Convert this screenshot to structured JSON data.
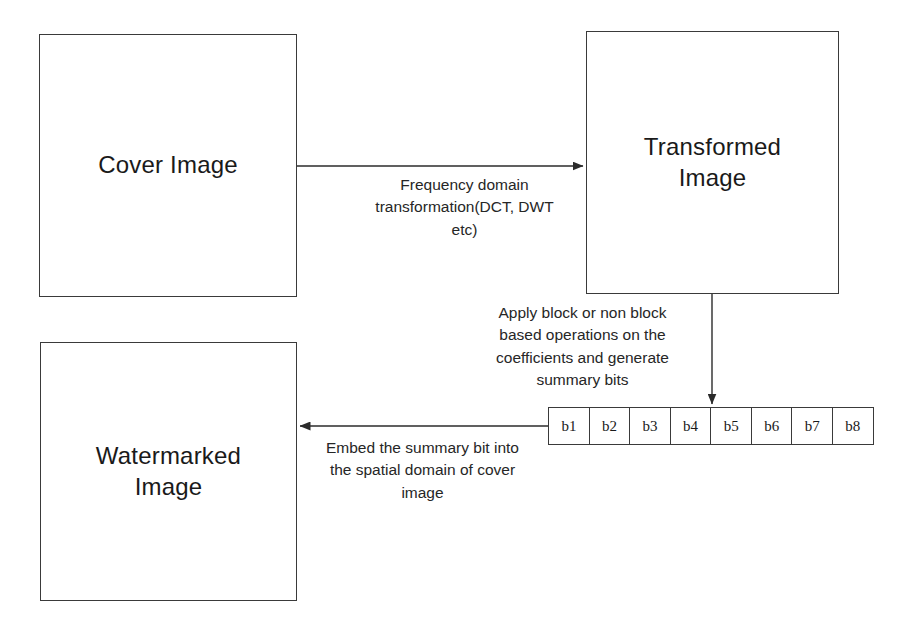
{
  "diagram": {
    "boxes": [
      {
        "id": "cover",
        "label": "Cover Image"
      },
      {
        "id": "transformed",
        "label": "Transformed\nImage"
      },
      {
        "id": "watermarked",
        "label": "Watermarked\nImage"
      }
    ],
    "edges": [
      {
        "id": "transform",
        "from": "cover",
        "to": "transformed",
        "direction": "right",
        "label": "Frequency domain\ntransformation(DCT, DWT\netc)"
      },
      {
        "id": "apply",
        "from": "transformed",
        "to": "bit-array",
        "direction": "down",
        "label": "Apply block or non block\nbased operations on the\ncoefficients and generate\nsummary bits"
      },
      {
        "id": "embed",
        "from": "bit-array",
        "to": "watermarked",
        "direction": "left",
        "label": "Embed the summary bit into\nthe spatial domain of cover\nimage"
      }
    ],
    "bit_array": {
      "name": "summary bits",
      "cells": [
        "b1",
        "b2",
        "b3",
        "b4",
        "b5",
        "b6",
        "b7",
        "b8"
      ]
    },
    "colors": {
      "stroke": "#3a3a3a",
      "text": "#1a1a1a",
      "background": "#ffffff"
    }
  }
}
